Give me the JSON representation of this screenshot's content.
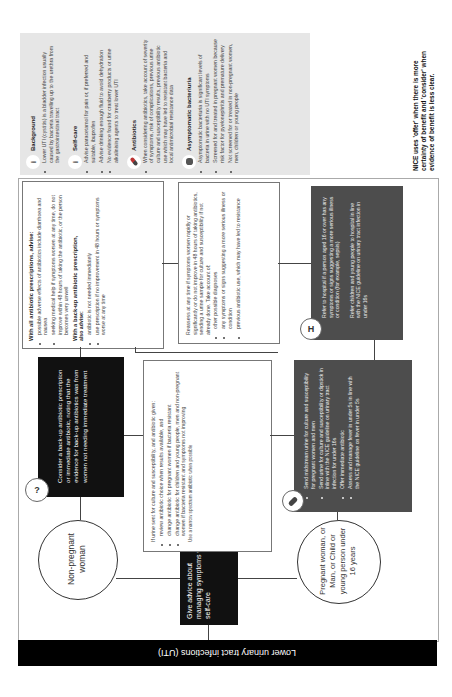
{
  "title": "Lower urinary tract infections (UTI)",
  "start_box": "Give advice about managing symptoms with self-care",
  "groups": {
    "non_pregnant": "Non-pregnant woman",
    "pregnant_etc": "Pregnant woman, or Man, or Child or young person under 16 years"
  },
  "backup_box": "Consider a back-up antibiotic prescription or immediate antibiotic, noting that the evidence for back-up antibiotics was from women not needing immediate treatment",
  "immediate_box": {
    "items": [
      "Send midstream urine for culture and susceptibility for pregnant women and men",
      "Send urine for culture and susceptibility or dipstick in inline with the NICE guideline on urinary tract infection for under 16s",
      "Offer immediate antibiotic",
      "Assess and manage fever in under 5s in line with the NICE guideline on fever in under 5s"
    ]
  },
  "advice_box": {
    "heading1": "With all antibiotic prescriptions, advise:",
    "items1": [
      "possible adverse effects of antibiotics include diarrhoea and nausea",
      "seeking medical help if symptoms worsen at any time, do not improve within 48 hours of taking the antibiotic, or the person becomes very unwell"
    ],
    "heading2": "With a back-up antibiotic prescription,",
    "heading2b": "also advise:",
    "items2": [
      "antibiotic is not needed immediately",
      "use prescription if no improvement in 48 hours or symptoms worse at any time"
    ]
  },
  "culture_box": {
    "intro": "If urine sent for culture and susceptibility, and antibiotic given:",
    "items": [
      "review antibiotic choice when results available, and",
      "change antibiotic for pregnant women if bacteria resistant",
      "change antibiotic for children and young people, men and non-pregnant women if bacteria resistant and symptoms not improving"
    ],
    "footnote": "Use a narrow spectrum antibiotic when possible"
  },
  "reassess_box": {
    "intro": "Reassess at any time if symptoms worsen rapidly or significantly or do not improve in 48 hours of taking antibiotics, sending a urine sample for culture and susceptibility if not already done. Take account of:",
    "items": [
      "other possible diagnoses",
      "any symptoms or signs suggesting a more serious illness or condition",
      "previous antibiotic use, which may have led to resistance"
    ]
  },
  "refer_box": {
    "icon": "H",
    "para1": "Refer to hospital if a person aged 16 or over has any symptoms or signs suggesting a more serious illness or condition (for example, sepsis)",
    "para2": "Refer children and young people to hospital in line with the NICE guideline on urinary tract infection in under 16s"
  },
  "sidebar": {
    "sections": [
      {
        "heading": "Background",
        "icon": "info-icon",
        "items": [
          "Lower UTI (cystitis) is a bladder infection usually caused by bacteria travelling up to the urethra from the gastrointestinal tract"
        ]
      },
      {
        "heading": "Self-care",
        "icon": "info-icon",
        "items": [
          "Advise paracetamol for pain or, if preferred and suitable, ibuprofen",
          "Advise drinking enough fluid to avoid dehydration",
          "No evidence found for cranberry products or urine alkalinising agents to treat lower UTI"
        ]
      },
      {
        "heading": "Antibiotics",
        "icon": "pill-icon",
        "items": [
          "When considering antibiotics, take account of severity of symptoms, risk of complications, previous urine culture and susceptibility results, previous antibiotic use which may have led to resistant bacteria and local antimicrobial resistance data"
        ]
      },
      {
        "heading": "Asymptomatic bacteriuria",
        "icon": "bacteria-icon",
        "items": [
          "Asymptomatic bacteriuria is significant levels of bacteria in urine with no UTI symptoms",
          "Screened for and treated in pregnant women because risk factor for pyelonephritis and premature delivery",
          "Not screened for or treated in non-pregnant women, men, children or young people"
        ]
      }
    ]
  },
  "note": "NICE uses 'offer' when there is more certainty of benefit and 'consider' when evidence of benefit is less clear.",
  "colors": {
    "title_bar": "#000000",
    "dark_box": "#111111",
    "grey_box": "#4d4d4d",
    "sidebar": "#e6e6e6"
  }
}
